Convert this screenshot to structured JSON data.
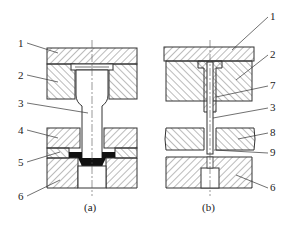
{
  "figure": {
    "subfigures": [
      {
        "id": "a",
        "caption": "(a)",
        "labels": [
          "1",
          "2",
          "3",
          "4",
          "5",
          "6"
        ]
      },
      {
        "id": "b",
        "caption": "(b)",
        "labels": [
          "1",
          "2",
          "7",
          "3",
          "8",
          "9",
          "6"
        ]
      }
    ]
  },
  "colors": {
    "line": "#333333",
    "hatch": "#555555",
    "fill_black": "#111111",
    "background": "#ffffff"
  }
}
